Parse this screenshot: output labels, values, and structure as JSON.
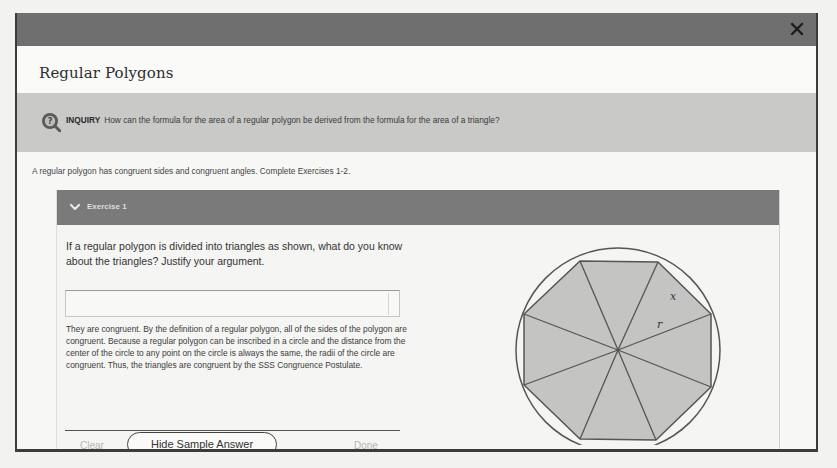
{
  "dialog": {
    "title": "Regular Polygons",
    "close_icon": "close-icon"
  },
  "inquiry": {
    "icon": "inquiry-magnifier-question-icon",
    "label": "INQUIRY",
    "text": "How can the formula for the area of a regular polygon be derived from the formula for the area of a triangle?"
  },
  "intro": "A regular polygon has congruent sides and congruent angles. Complete Exercises 1-2.",
  "exercise": {
    "header": "Exercise 1",
    "chevron_icon": "chevron-down-icon",
    "question": "If a regular polygon is divided into triangles as shown, what do you know about the triangles? Justify your argument.",
    "answer_value": "",
    "sample_answer": "They are congruent. By the definition of a regular polygon, all of the sides of the polygon are congruent. Because a regular polygon can be inscribed in a circle and the distance from the center of the circle to any point on the circle is always the same, the radii of the circle are congruent. Thus, the triangles are congruent by the SSS Congruence Postulate.",
    "buttons": {
      "clear": "Clear",
      "hide_sample": "Hide Sample Answer",
      "done": "Done"
    },
    "figure": {
      "shape": "regular octagon inscribed in circle, divided into 8 triangles from center",
      "label_side": "x",
      "label_radius": "r"
    }
  },
  "colors": {
    "topbar": "#6f6f6f",
    "inquiry_band": "#c9c9c7",
    "card_header": "#7a7a7a",
    "polygon_fill": "#c4c4c2",
    "stroke": "#555555"
  }
}
